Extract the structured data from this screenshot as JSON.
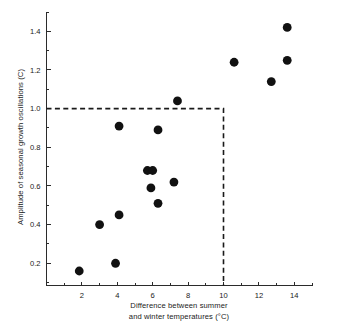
{
  "chart_data": {
    "type": "scatter",
    "title": "",
    "xlabel": "Difference between summer and winter temperatures (°C)",
    "xlabel_line1": "Difference between summer",
    "xlabel_line2": "and winter temperatures (°C)",
    "ylabel": "Amplitude of seasonal growth oscillations (C)",
    "xlim": [
      0,
      15
    ],
    "ylim": [
      0.085,
      1.5
    ],
    "xticks": [
      2,
      4,
      6,
      8,
      10,
      12,
      14
    ],
    "xticklabels": [
      "2",
      "4",
      "6",
      "8",
      "10",
      "12",
      "14"
    ],
    "xminorticks": [
      1,
      3,
      5,
      7,
      9,
      11,
      13,
      15
    ],
    "yticks": [
      0.2,
      0.4,
      0.6,
      0.8,
      1.0,
      1.2,
      1.4
    ],
    "yticklabels": [
      "0.2",
      "0.4",
      "0.6",
      "0.8",
      "1.0",
      "1.2",
      "1.4"
    ],
    "yminorticks": [
      0.1,
      0.3,
      0.5,
      0.7,
      0.9,
      1.1,
      1.3,
      1.5
    ],
    "grid": false,
    "legend": false,
    "marker": "filled-circle",
    "marker_color": "#111111",
    "marker_size": 4.4,
    "x": [
      1.85,
      3.0,
      3.9,
      4.1,
      4.1,
      5.7,
      5.9,
      6.0,
      6.3,
      6.3,
      7.2,
      7.4,
      10.6,
      12.7,
      13.6,
      13.6
    ],
    "y": [
      0.16,
      0.4,
      0.2,
      0.45,
      0.91,
      0.68,
      0.59,
      0.68,
      0.89,
      0.51,
      0.62,
      1.04,
      1.24,
      1.14,
      1.42,
      1.25
    ],
    "points": [
      {
        "x": 1.85,
        "y": 0.16
      },
      {
        "x": 3.0,
        "y": 0.4
      },
      {
        "x": 3.9,
        "y": 0.2
      },
      {
        "x": 4.1,
        "y": 0.45
      },
      {
        "x": 4.1,
        "y": 0.91
      },
      {
        "x": 5.7,
        "y": 0.68
      },
      {
        "x": 5.9,
        "y": 0.59
      },
      {
        "x": 6.0,
        "y": 0.68
      },
      {
        "x": 6.3,
        "y": 0.89
      },
      {
        "x": 6.3,
        "y": 0.51
      },
      {
        "x": 7.2,
        "y": 0.62
      },
      {
        "x": 7.4,
        "y": 1.04
      },
      {
        "x": 10.6,
        "y": 1.24
      },
      {
        "x": 12.7,
        "y": 1.14
      },
      {
        "x": 13.6,
        "y": 1.42
      },
      {
        "x": 13.6,
        "y": 1.25
      }
    ],
    "annotations": [
      {
        "name": "threshold-box",
        "style": "dashed",
        "color": "#1a1a1a",
        "description": "Dashed lines at y = 1.0 (horizontal, from y-axis to x = 10) and x = 10 (vertical, from y = 1.0 down to x-axis)",
        "y_value": 1.0,
        "x_value": 10
      }
    ]
  }
}
